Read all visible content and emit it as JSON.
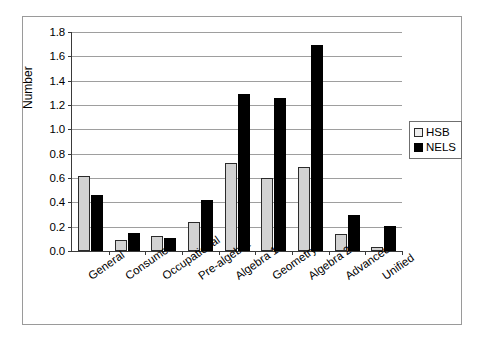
{
  "chart_data": {
    "type": "bar",
    "title": "",
    "subtitle": "",
    "xlabel": "",
    "ylabel": "Number",
    "ylim": [
      0.0,
      1.8
    ],
    "ytick_labels": [
      "0.0",
      "0.2",
      "0.4",
      "0.6",
      "0.8",
      "1.0",
      "1.2",
      "1.4",
      "1.6",
      "1.8"
    ],
    "ytick_values": [
      0.0,
      0.2,
      0.4,
      0.6,
      0.8,
      1.0,
      1.2,
      1.4,
      1.6,
      1.8
    ],
    "grid": true,
    "grid_axis": "y",
    "legend_position": "right",
    "categories": [
      "General",
      "Consumer",
      "Occupational",
      "Pre-algebra",
      "Algebra 1",
      "Geometry",
      "Algebra 2",
      "Advanced",
      "Unified"
    ],
    "series": [
      {
        "name": "HSB",
        "color": "#d2d2d2",
        "values": [
          0.62,
          0.09,
          0.12,
          0.24,
          0.72,
          0.6,
          0.69,
          0.14,
          0.035
        ]
      },
      {
        "name": "NELS",
        "color": "#000000",
        "values": [
          0.46,
          0.145,
          0.11,
          0.42,
          1.29,
          1.26,
          1.69,
          0.295,
          0.205
        ]
      }
    ]
  },
  "legend": {
    "items": [
      {
        "label": "HSB",
        "swatch": "hsb"
      },
      {
        "label": "NELS",
        "swatch": "nels"
      }
    ]
  }
}
